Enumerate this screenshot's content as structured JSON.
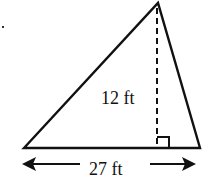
{
  "figure": {
    "shape": "triangle",
    "height_label": "12 ft",
    "base_label": "27 ft",
    "right_angle_marker": true,
    "colors": {
      "stroke": "#111111",
      "background": "#ffffff"
    }
  }
}
